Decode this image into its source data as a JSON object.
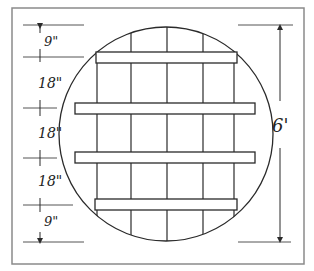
{
  "diagram": {
    "colors": {
      "line": "#2a2a2a",
      "frame": "#7a7a7a",
      "background": "#ffffff"
    },
    "left_dimensions": [
      {
        "label": "9\""
      },
      {
        "label": "18\""
      },
      {
        "label": "18\""
      },
      {
        "label": "18\""
      },
      {
        "label": "9\""
      }
    ],
    "right_dimension": {
      "label": "6'"
    },
    "planks": 4,
    "vertical_boards": 5
  }
}
